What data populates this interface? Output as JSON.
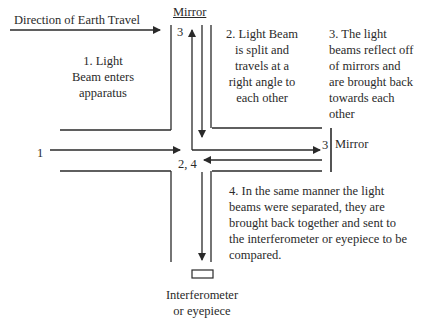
{
  "diagram": {
    "title_direction": "Direction of Earth Travel",
    "mirror_top_label": "Mirror",
    "mirror_right_label": "Mirror",
    "step1": [
      "1. Light",
      "Beam enters",
      "apparatus"
    ],
    "step2": [
      "2. Light Beam",
      "is split and",
      "travels at a",
      "right angle to",
      "each other"
    ],
    "step3": [
      "3. The light",
      "beams reflect off",
      "of mirrors and",
      "are brought back",
      "towards each",
      "other"
    ],
    "step4": [
      "4. In the same manner the light",
      "beams were separated, they are",
      "brought back together and sent to",
      "the interferometer or eyepiece to be",
      "compared."
    ],
    "markers": {
      "entry": "1",
      "top_mirror": "3",
      "right_mirror": "3",
      "splitter": "2, 4"
    },
    "eyepiece_label": [
      "Interferometer",
      "or eyepiece"
    ],
    "colors": {
      "line": "#2a2a2a",
      "background": "#ffffff"
    }
  }
}
